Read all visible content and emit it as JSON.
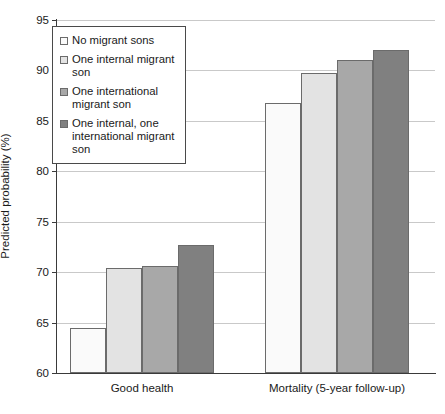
{
  "chart_data": {
    "type": "bar",
    "title": "",
    "xlabel": "",
    "ylabel": "Predicted probability (%)",
    "ylim": [
      60,
      95
    ],
    "yticks": [
      60,
      65,
      70,
      75,
      80,
      85,
      90,
      95
    ],
    "ytick_labels": [
      "60",
      "65",
      "70",
      "75",
      "80",
      "85",
      "90",
      "95"
    ],
    "grid": true,
    "legend_position": "upper-left",
    "categories": [
      "Good health",
      "Mortality (5-year follow-up)"
    ],
    "series": [
      {
        "name": "No migrant sons",
        "color": "#fafafa",
        "values": [
          64.5,
          86.8
        ]
      },
      {
        "name": "One internal migrant son",
        "color": "#e3e3e3",
        "values": [
          70.4,
          89.7
        ]
      },
      {
        "name": "One international migrant son",
        "color": "#a8a8a8",
        "values": [
          70.6,
          91.0
        ]
      },
      {
        "name": "One internal, one international migrant son",
        "color": "#808080",
        "values": [
          72.7,
          92.0
        ]
      }
    ]
  },
  "legend": {
    "items": [
      {
        "label": "No migrant sons",
        "color": "#fafafa"
      },
      {
        "label": "One internal migrant son",
        "color": "#e3e3e3"
      },
      {
        "label": "One international migrant son",
        "color": "#a8a8a8"
      },
      {
        "label": "One internal, one international migrant son",
        "color": "#808080"
      }
    ]
  }
}
